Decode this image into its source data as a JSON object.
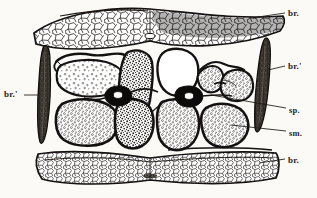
{
  "figure": {
    "background_color": "#fbfaf7",
    "ink_color": "#1a1713",
    "type": "histological-line-drawing"
  },
  "labels": [
    {
      "id": "label-br-top-right",
      "text": "br.",
      "meaning": "bark tissue, upper band",
      "x": 288,
      "y": 9,
      "leader": {
        "x1": 258,
        "y1": 17,
        "x2": 285,
        "y2": 13
      }
    },
    {
      "id": "label-br-prime-right",
      "text": "br.'",
      "meaning": "bract, right",
      "x": 288,
      "y": 62,
      "leader": {
        "x1": 268,
        "y1": 70,
        "x2": 285,
        "y2": 66
      }
    },
    {
      "id": "label-sp",
      "text": "sp.",
      "meaning": "sieve plate",
      "x": 289,
      "y": 106,
      "leader": {
        "x1": 211,
        "y1": 95,
        "x2": 286,
        "y2": 108
      }
    },
    {
      "id": "label-sm",
      "text": "sm.",
      "meaning": "sieve member",
      "x": 289,
      "y": 129,
      "leader": {
        "x1": 231,
        "y1": 125,
        "x2": 286,
        "y2": 131
      }
    },
    {
      "id": "label-br-bottom-right",
      "text": "br.",
      "meaning": "bark tissue, lower band",
      "x": 288,
      "y": 156,
      "leader": {
        "x1": 259,
        "y1": 163,
        "x2": 285,
        "y2": 159
      }
    },
    {
      "id": "label-br-prime-left",
      "text": "br.'",
      "meaning": "bract, left",
      "x": 6,
      "y": 90,
      "leader": {
        "x1": 24,
        "y1": 95,
        "x2": 38,
        "y2": 95
      }
    }
  ],
  "structures": {
    "upper_bark_band": {
      "name": "upper bark band",
      "description": "horizontal band of polygonal parenchyma cells spanning the figure width"
    },
    "lower_bark_band": {
      "name": "lower bark band",
      "description": "horizontal band of polygonal parenchyma cells spanning the figure width"
    },
    "left_bract": {
      "name": "left bract",
      "description": "dark elongated spindle shape, vertical"
    },
    "right_bract": {
      "name": "right bract",
      "description": "dark elongated spindle shape, vertical"
    },
    "sieve_plates": {
      "name": "sieve plates",
      "count": 2,
      "description": "dark diamond-shaped bodies with pale central lumen"
    },
    "sieve_members": {
      "name": "sieve members",
      "count": 6,
      "description": "large rounded cells with dark walls and stippled granular contents"
    }
  }
}
